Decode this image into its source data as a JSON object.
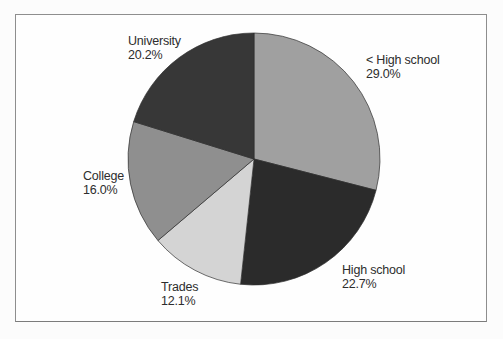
{
  "chart_data": {
    "type": "pie",
    "title": "",
    "start_angle_deg": 0,
    "direction": "clockwise",
    "legend": "none",
    "label_style": "category name + percent, outside slices",
    "slices": [
      {
        "label": "< High school",
        "value": 29.0,
        "display": "29.0%",
        "color": "#a0a0a0"
      },
      {
        "label": "High school",
        "value": 22.7,
        "display": "22.7%",
        "color": "#2b2b2b"
      },
      {
        "label": "Trades",
        "value": 12.1,
        "display": "12.1%",
        "color": "#d4d4d4"
      },
      {
        "label": "College",
        "value": 16.0,
        "display": "16.0%",
        "color": "#8f8f8f"
      },
      {
        "label": "University",
        "value": 20.2,
        "display": "20.2%",
        "color": "#373737"
      }
    ],
    "outline_color": "#2e2e2e",
    "text_color": "#2d2d2d",
    "frame_border_color": "#8e8e8e",
    "background_color": "#fefefe"
  }
}
